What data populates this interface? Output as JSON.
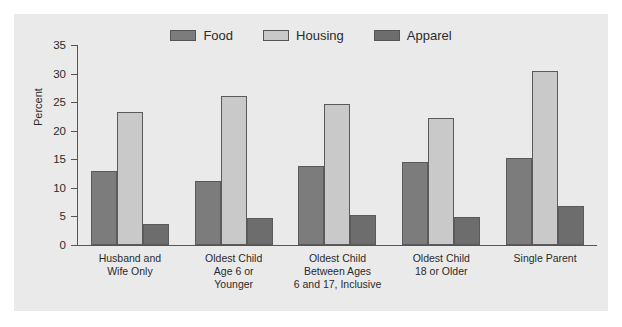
{
  "chart_data": {
    "type": "bar",
    "title": "",
    "xlabel": "",
    "ylabel": "Percent",
    "ylim": [
      0,
      35
    ],
    "yticks": [
      "0",
      "5",
      "10",
      "15",
      "20",
      "25",
      "30",
      "35"
    ],
    "grid": false,
    "legend_position": "top-center",
    "categories": [
      "Husband and\nWife Only",
      "Oldest Child\nAge 6 or\nYounger",
      "Oldest Child\nBetween Ages\n6 and 17, Inclusive",
      "Oldest Child\n18 or Older",
      "Single Parent"
    ],
    "series": [
      {
        "name": "Food",
        "color": "#7c7c7c",
        "values": [
          12.9,
          11.2,
          13.8,
          14.6,
          15.2
        ]
      },
      {
        "name": "Housing",
        "color": "#c9c9c9",
        "values": [
          23.2,
          26.1,
          24.7,
          22.2,
          30.4
        ]
      },
      {
        "name": "Apparel",
        "color": "#6d6d6d",
        "values": [
          3.7,
          4.8,
          5.2,
          4.9,
          6.8
        ]
      }
    ]
  },
  "legend": {
    "items": [
      {
        "label": "Food",
        "swatch": "legend-swatch-food"
      },
      {
        "label": "Housing",
        "swatch": "legend-swatch-housing"
      },
      {
        "label": "Apparel",
        "swatch": "legend-swatch-apparel"
      }
    ]
  },
  "axes": {
    "y_axis_title": "Percent"
  },
  "colors": {
    "panel_background": "#eaeaea",
    "page_background": "#ffffff",
    "axis": "#555555",
    "text": "#2a2a2a"
  }
}
